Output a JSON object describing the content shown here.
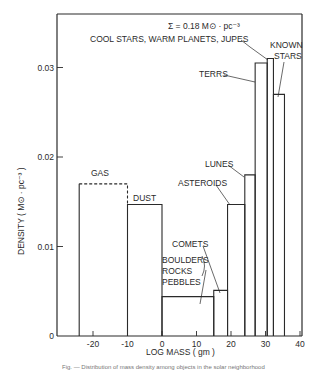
{
  "chart_data": {
    "type": "bar",
    "title": "",
    "annotation_sum": "Σ = 0.18 M⊙ · pc⁻³",
    "subtitle_label": "COOL STARS, WARM PLANETS, JUPES",
    "xlabel": "LOG MASS  ( gm )",
    "ylabel": "DENSITY  ( M⊙ · pc⁻³ )",
    "xlim": [
      -28,
      41
    ],
    "ylim": [
      0,
      0.035
    ],
    "xticks": [
      -20,
      -10,
      0,
      10,
      20,
      30,
      40
    ],
    "xtick_labels": [
      "-20",
      "-10",
      "0",
      "10",
      "20",
      "30",
      "40"
    ],
    "yticks": [
      0,
      0.01,
      0.02,
      0.03
    ],
    "ytick_labels": [
      "0",
      "0.01",
      "0.02",
      "0.03"
    ],
    "grid": false,
    "legend": null,
    "bars": [
      {
        "name": "GAS",
        "x0": -24,
        "x1": -10,
        "value": 0.017,
        "style": "dashed-top"
      },
      {
        "name": "DUST",
        "x0": -10,
        "x1": 0,
        "value": 0.0147
      },
      {
        "name": "BOULDERS, ROCKS, PEBBLES",
        "x0": 0,
        "x1": 15,
        "value": 0.0044
      },
      {
        "name": "COMETS",
        "x0": 15,
        "x1": 19,
        "value": 0.0051
      },
      {
        "name": "ASTEROIDS",
        "x0": 19,
        "x1": 24,
        "value": 0.0147
      },
      {
        "name": "LUNES",
        "x0": 24,
        "x1": 27,
        "value": 0.018
      },
      {
        "name": "TERRS",
        "x0": 27,
        "x1": 30.5,
        "value": 0.0305
      },
      {
        "name": "JUPES",
        "x0": 30.5,
        "x1": 32.3,
        "value": 0.031
      },
      {
        "name": "KNOWN STARS",
        "x0": 32.3,
        "x1": 35.5,
        "value": 0.027
      }
    ],
    "labels": {
      "gas": "GAS",
      "dust": "DUST",
      "comets": "COMETS",
      "boulders": "BOULDERS",
      "rocks": "ROCKS",
      "pebbles": "PEBBLES",
      "asteroids": "ASTEROIDS",
      "lunes": "LUNES",
      "terrs": "TERRS",
      "known": "KNOWN",
      "stars": "STARS"
    }
  },
  "caption_fragment": "Fig. — Distribution of mass density among objects in the solar neighborhood"
}
